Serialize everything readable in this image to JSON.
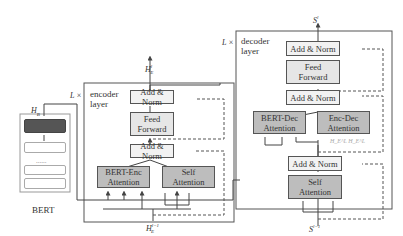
{
  "bert": {
    "label": "BERT",
    "output_label": "H_B",
    "dots": "......"
  },
  "encoder": {
    "repeat_label": "L ×",
    "layer_label_line1": "encoder",
    "layer_label_line2": "layer",
    "output_label": "H_E^l",
    "input_label": "H_E^{l-1}",
    "blocks": {
      "add_norm_top": "Add & Norm",
      "feed_forward_line1": "Feed",
      "feed_forward_line2": "Forward",
      "add_norm_mid": "Add & Norm",
      "bert_enc_line1": "BERT-Enc",
      "bert_enc_line2": "Attention",
      "self_att_line1": "Self",
      "self_att_line2": "Attention"
    }
  },
  "decoder": {
    "repeat_label": "L ×",
    "layer_label_line1": "decoder",
    "layer_label_line2": "layer",
    "output_label": "S^l",
    "input_label": "S^{l-1}",
    "blocks": {
      "add_norm_top": "Add & Norm",
      "feed_forward_line1": "Feed",
      "feed_forward_line2": "Forward",
      "add_norm_mid": "Add & Norm",
      "bert_dec_line1": "BERT-Dec",
      "bert_dec_line2": "Attention",
      "enc_dec_line1": "Enc-Dec",
      "enc_dec_line2": "Attention",
      "enc_dec_inputs": "H_E^L  H_E^L",
      "add_norm_bottom": "Add & Norm",
      "self_att_line1": "Self",
      "self_att_line2": "Attention"
    }
  },
  "colors": {
    "line": "#444444",
    "dashed": "#555555",
    "dark_block": "#bdbdbd",
    "light_block": "#f2f2f2",
    "bert_top_layer": "#555555"
  }
}
